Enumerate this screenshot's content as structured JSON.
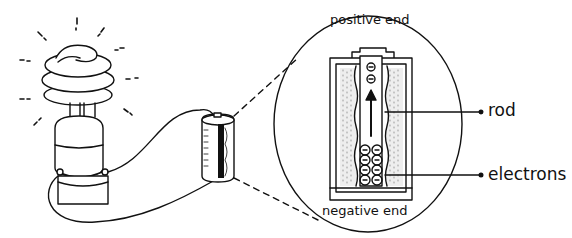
{
  "diagram": {
    "type": "circuit-illustration",
    "components": {
      "bulb": "compact fluorescent light bulb (lit)",
      "battery": "cell battery",
      "magnified_view": "cross-section of battery"
    },
    "labels": {
      "positive_end": "positive end",
      "negative_end": "negative end",
      "rod": "rod",
      "electrons": "electrons"
    },
    "electron_symbol": "−",
    "colors": {
      "line": "#111111",
      "background": "#ffffff"
    }
  }
}
